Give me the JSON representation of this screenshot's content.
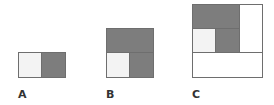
{
  "figures": [
    {
      "label": "A",
      "description": "1x2 rectangle: light square and dark square"
    },
    {
      "label": "B",
      "description": "2x2 square: dark 2x1 rectangle on top of figure A"
    },
    {
      "label": "C",
      "description": "3x3 square: figure B plus white 1x2 column right and white 3x1 row below"
    }
  ],
  "colors": {
    "dark": "#7d7d7d",
    "light": "#f3f3f3",
    "white": "#ffffff",
    "border": "#6e6e6e"
  }
}
